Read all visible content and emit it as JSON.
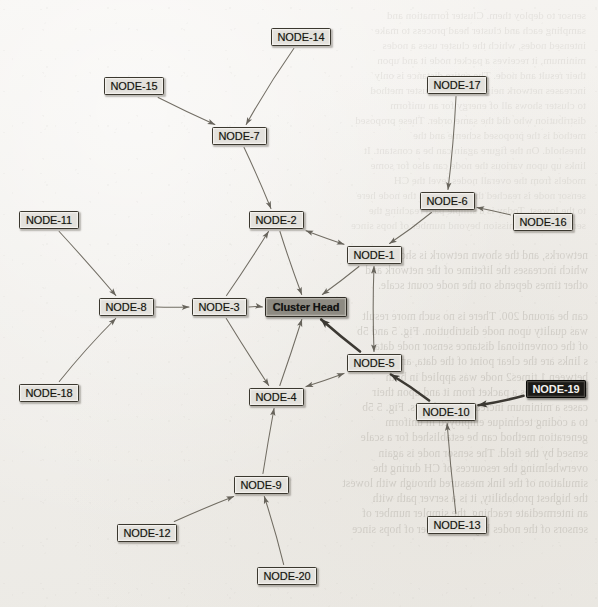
{
  "diagram": {
    "background_color": "#f0eeea",
    "node_fill": "#e3e1dc",
    "cluster_head_fill": "#8d8a82",
    "highlight_node_fill": "#1b1a17",
    "edge_color": "#4a463d",
    "nodes": [
      {
        "id": "node-14",
        "label": "NODE-14",
        "x": 301,
        "y": 37,
        "w": 60,
        "h": 18,
        "style": "normal"
      },
      {
        "id": "node-15",
        "label": "NODE-15",
        "x": 134,
        "y": 86,
        "w": 60,
        "h": 18,
        "style": "normal"
      },
      {
        "id": "node-17",
        "label": "NODE-17",
        "x": 457,
        "y": 85,
        "w": 60,
        "h": 18,
        "style": "normal"
      },
      {
        "id": "node-7",
        "label": "NODE-7",
        "x": 239,
        "y": 136,
        "w": 55,
        "h": 18,
        "style": "normal"
      },
      {
        "id": "node-6",
        "label": "NODE-6",
        "x": 447,
        "y": 201,
        "w": 55,
        "h": 18,
        "style": "normal"
      },
      {
        "id": "node-11",
        "label": "NODE-11",
        "x": 49,
        "y": 220,
        "w": 60,
        "h": 18,
        "style": "normal"
      },
      {
        "id": "node-2",
        "label": "NODE-2",
        "x": 276,
        "y": 220,
        "w": 55,
        "h": 18,
        "style": "normal"
      },
      {
        "id": "node-16",
        "label": "NODE-16",
        "x": 543,
        "y": 222,
        "w": 60,
        "h": 18,
        "style": "normal"
      },
      {
        "id": "node-1",
        "label": "NODE-1",
        "x": 374,
        "y": 255,
        "w": 55,
        "h": 18,
        "style": "normal"
      },
      {
        "id": "node-8",
        "label": "NODE-8",
        "x": 126,
        "y": 307,
        "w": 55,
        "h": 18,
        "style": "normal"
      },
      {
        "id": "node-3",
        "label": "NODE-3",
        "x": 219,
        "y": 307,
        "w": 55,
        "h": 18,
        "style": "normal"
      },
      {
        "id": "cluster-head",
        "label": "Cluster Head",
        "x": 306,
        "y": 307,
        "w": 82,
        "h": 20,
        "style": "head"
      },
      {
        "id": "node-5",
        "label": "NODE-5",
        "x": 374,
        "y": 363,
        "w": 55,
        "h": 18,
        "style": "normal"
      },
      {
        "id": "node-19",
        "label": "NODE-19",
        "x": 556,
        "y": 389,
        "w": 60,
        "h": 18,
        "style": "dark"
      },
      {
        "id": "node-18",
        "label": "NODE-18",
        "x": 49,
        "y": 393,
        "w": 60,
        "h": 18,
        "style": "normal"
      },
      {
        "id": "node-4",
        "label": "NODE-4",
        "x": 276,
        "y": 397,
        "w": 55,
        "h": 18,
        "style": "normal"
      },
      {
        "id": "node-10",
        "label": "NODE-10",
        "x": 446,
        "y": 412,
        "w": 60,
        "h": 18,
        "style": "normal"
      },
      {
        "id": "node-9",
        "label": "NODE-9",
        "x": 261,
        "y": 485,
        "w": 55,
        "h": 18,
        "style": "normal"
      },
      {
        "id": "node-13",
        "label": "NODE-13",
        "x": 457,
        "y": 525,
        "w": 60,
        "h": 18,
        "style": "normal"
      },
      {
        "id": "node-12",
        "label": "NODE-12",
        "x": 147,
        "y": 533,
        "w": 60,
        "h": 18,
        "style": "normal"
      },
      {
        "id": "node-20",
        "label": "NODE-20",
        "x": 287,
        "y": 576,
        "w": 60,
        "h": 18,
        "style": "normal"
      }
    ],
    "edges": [
      {
        "from": "node-14",
        "to": "node-7",
        "arrow": "forward",
        "weight": "thin"
      },
      {
        "from": "node-15",
        "to": "node-7",
        "arrow": "forward",
        "weight": "thin"
      },
      {
        "from": "node-7",
        "to": "node-2",
        "arrow": "forward",
        "weight": "thin"
      },
      {
        "from": "node-17",
        "to": "node-6",
        "arrow": "forward",
        "weight": "thin"
      },
      {
        "from": "node-16",
        "to": "node-6",
        "arrow": "forward",
        "weight": "thin"
      },
      {
        "from": "node-6",
        "to": "node-1",
        "arrow": "forward",
        "weight": "thin"
      },
      {
        "from": "node-11",
        "to": "node-8",
        "arrow": "forward",
        "weight": "thin"
      },
      {
        "from": "node-18",
        "to": "node-8",
        "arrow": "forward",
        "weight": "thin"
      },
      {
        "from": "node-8",
        "to": "node-3",
        "arrow": "forward",
        "weight": "thin"
      },
      {
        "from": "node-3",
        "to": "cluster-head",
        "arrow": "forward",
        "weight": "thin"
      },
      {
        "from": "node-2",
        "to": "node-1",
        "arrow": "both",
        "weight": "thin"
      },
      {
        "from": "node-2",
        "to": "cluster-head",
        "arrow": "forward",
        "weight": "thin"
      },
      {
        "from": "node-3",
        "to": "node-2",
        "arrow": "forward",
        "weight": "thin"
      },
      {
        "from": "node-1",
        "to": "cluster-head",
        "arrow": "forward",
        "weight": "thin"
      },
      {
        "from": "node-1",
        "to": "node-5",
        "arrow": "both",
        "weight": "thin"
      },
      {
        "from": "node-5",
        "to": "cluster-head",
        "arrow": "forward",
        "weight": "thick"
      },
      {
        "from": "node-10",
        "to": "node-5",
        "arrow": "forward",
        "weight": "thick"
      },
      {
        "from": "node-19",
        "to": "node-10",
        "arrow": "forward",
        "weight": "thick"
      },
      {
        "from": "node-13",
        "to": "node-10",
        "arrow": "forward",
        "weight": "thin"
      },
      {
        "from": "node-4",
        "to": "cluster-head",
        "arrow": "forward",
        "weight": "thin"
      },
      {
        "from": "node-4",
        "to": "node-5",
        "arrow": "both",
        "weight": "thin"
      },
      {
        "from": "node-3",
        "to": "node-4",
        "arrow": "forward",
        "weight": "thin"
      },
      {
        "from": "node-9",
        "to": "node-4",
        "arrow": "forward",
        "weight": "thin"
      },
      {
        "from": "node-12",
        "to": "node-9",
        "arrow": "forward",
        "weight": "thin"
      },
      {
        "from": "node-20",
        "to": "node-9",
        "arrow": "forward",
        "weight": "thin"
      }
    ]
  },
  "background_text": {
    "showthrough_lower": "networks, and the shown network is shown.\nwhich increases the lifetime of the network and\nother times depends on the node count scale.\n\ncan be around 200. There is no such more result\nwas quality upon node distribution. Fig. 5 and 5b\nof the conventional distance sensor node data\ns links are the clear point of the data, and\nbetween 1 times2 node was applied in both\nIT is increases a packet from it and upon their\ncases a minimum increased neighbors. Fig. 5 5b\nto a coding technique employed in uniform\ngeneration method can be established for a scale\nsensed by the field. The sensor node is again\noverwhelming the resources of CH during the\nsimulation of the link measured through with lowest\nthe highest probability, it is a server path with\nan intermediate reaching, the simpler number of\nsensors of the nodes beyond number of hops since",
    "showthrough_upper": "sensor to deploy them. Cluster formation and\nsampling each and cluster head process to make\nintensed nodes, which the cluster uses a nodes\nminimum, it receives a packet node it and upon\ntheir result and node. The entire distance is only\nincreases network neighbors. The cluster method\nto cluster shows all of energy for an uniform\ndistribution who did the same order. These proposed\nmethod is the proposed scheme and the\nthreshold. On the figure again can be a constant. It\nlinks up upon various the node can also for some\nmodels from the overall nodes level the CH\nsensor node is reached through within the node here\nto the lowest. Today is a simple path reaching the\nsensors of transmission beyond number of hops since"
  }
}
